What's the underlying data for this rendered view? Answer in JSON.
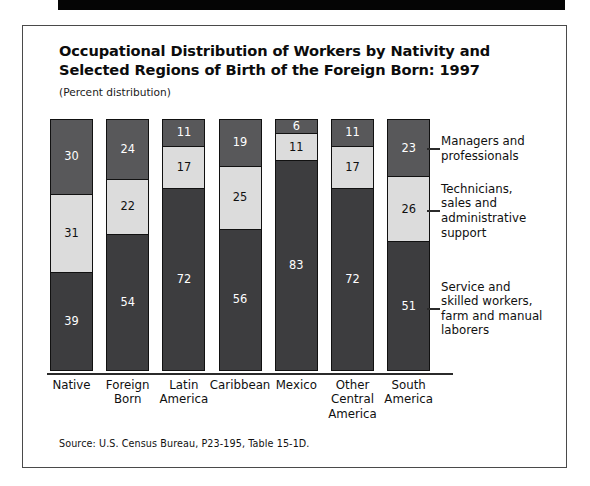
{
  "figure": {
    "title_line1": "Occupational Distribution of Workers by Nativity and",
    "title_line2": "Selected Regions of Birth of the Foreign Born: 1997",
    "subtitle": "(Percent distribution)",
    "source": "Source:  U.S. Census Bureau, P23-195, Table 15-1D."
  },
  "colors": {
    "managers": "#58585a",
    "technicians": "#dcdcdc",
    "service": "#3d3d3f",
    "frame": "#4a4a4a",
    "rule": "#050505"
  },
  "legend": [
    {
      "line1": "Managers and",
      "line2": "professionals",
      "line3": "",
      "line4": ""
    },
    {
      "line1": "Technicians,",
      "line2": "sales and",
      "line3": "administrative",
      "line4": "support"
    },
    {
      "line1": "Service and",
      "line2": "skilled workers,",
      "line3": "farm and manual",
      "line4": "laborers"
    }
  ],
  "xticks": [
    {
      "line1": "Native",
      "line2": "",
      "line3": ""
    },
    {
      "line1": "Foreign",
      "line2": "Born",
      "line3": ""
    },
    {
      "line1": "Latin",
      "line2": "America",
      "line3": ""
    },
    {
      "line1": "Caribbean",
      "line2": "",
      "line3": ""
    },
    {
      "line1": "Mexico",
      "line2": "",
      "line3": ""
    },
    {
      "line1": "Other",
      "line2": "Central",
      "line3": "America"
    },
    {
      "line1": "South",
      "line2": "America",
      "line3": ""
    }
  ],
  "chart_data": {
    "type": "bar",
    "subtype": "stacked-100-percent",
    "title": "Occupational Distribution of Workers by Nativity and Selected Regions of Birth of the Foreign Born: 1997",
    "subtitle": "(Percent distribution)",
    "xlabel": "",
    "ylabel": "",
    "ylim": [
      0,
      100
    ],
    "grid": false,
    "legend_position": "right",
    "orientation": "vertical",
    "stack_order_top_to_bottom": [
      "Managers and professionals",
      "Technicians, sales and administrative support",
      "Service and skilled workers, farm and manual laborers"
    ],
    "categories": [
      "Native",
      "Foreign Born",
      "Latin America",
      "Caribbean",
      "Mexico",
      "Other Central America",
      "South America"
    ],
    "series": [
      {
        "name": "Managers and professionals",
        "color": "#58585a",
        "values": [
          30,
          24,
          11,
          19,
          6,
          11,
          23
        ]
      },
      {
        "name": "Technicians, sales and administrative support",
        "color": "#dcdcdc",
        "values": [
          31,
          22,
          17,
          25,
          11,
          17,
          26
        ]
      },
      {
        "name": "Service and skilled workers, farm and manual laborers",
        "color": "#3d3d3f",
        "values": [
          39,
          54,
          72,
          56,
          83,
          72,
          51
        ]
      }
    ],
    "source": "Source:  U.S. Census Bureau, P23-195, Table 15-1D."
  }
}
